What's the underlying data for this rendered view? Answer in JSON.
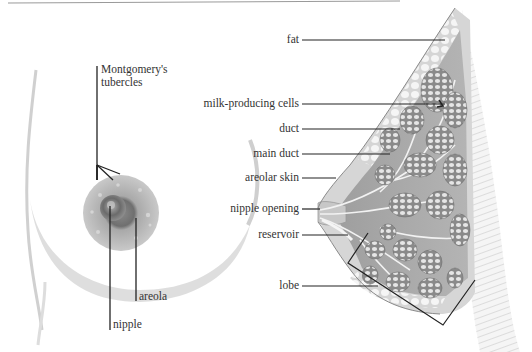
{
  "figure": {
    "type": "anatomical-illustration",
    "colors": {
      "line": "#2b2b2b",
      "skin_shade": "#bdbdbd",
      "tissue": "#9a9a9a",
      "lobule": "#7d7d7d",
      "fat": "#e4e4e4"
    }
  },
  "external_view": {
    "labels": [
      {
        "id": "montgomery",
        "line1": "Montgomery's",
        "line2": "tubercles"
      },
      {
        "id": "areola",
        "text": "areola"
      },
      {
        "id": "nipple",
        "text": "nipple"
      }
    ]
  },
  "cross_section": {
    "labels": [
      {
        "id": "fat",
        "text": "fat"
      },
      {
        "id": "milk_cells",
        "text": "milk-producing cells"
      },
      {
        "id": "duct",
        "text": "duct"
      },
      {
        "id": "main_duct",
        "text": "main duct"
      },
      {
        "id": "areolar_skin",
        "text": "areolar skin"
      },
      {
        "id": "nipple_opening",
        "text": "nipple opening"
      },
      {
        "id": "reservoir",
        "text": "reservoir"
      },
      {
        "id": "lobe",
        "text": "lobe"
      }
    ]
  }
}
